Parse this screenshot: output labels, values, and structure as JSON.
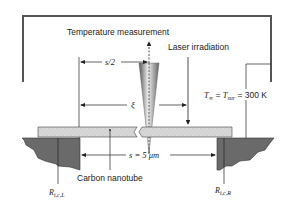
{
  "labels": {
    "temperature_measurement": "Temperature measurement",
    "laser_irradiation": "Laser irradiation",
    "half_length": "s/2",
    "xi": "ξ",
    "ambient": "T∞ = Tsur = 300 K",
    "ambient_T": "T",
    "ambient_inf": "∞",
    "ambient_eq1": " = ",
    "ambient_Tsur": "T",
    "ambient_sur": "sur",
    "ambient_value": " = 300 K",
    "span": "s = 5 μm",
    "carbon_nanotube": "Carbon nanotube",
    "r_left": "R",
    "r_left_sub": "t,c,L",
    "r_right": "R",
    "r_right_sub": "t,c,R"
  },
  "colors": {
    "enclosure": "#555555",
    "nanotube_fill": "#d4d4d4",
    "support_fill": "#6a6a6a",
    "line": "#222222"
  }
}
